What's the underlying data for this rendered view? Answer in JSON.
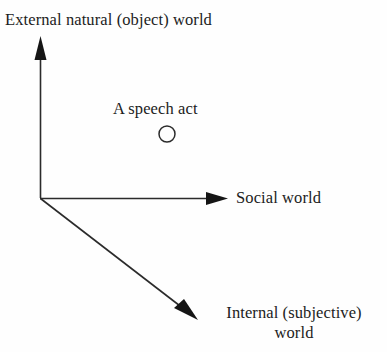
{
  "diagram": {
    "type": "three-axis-world-diagram",
    "background_color": "#fefefe",
    "line_color": "#2b2b2b",
    "text_color": "#1c1c1c",
    "origin": {
      "x": 40,
      "y": 198
    },
    "axes": [
      {
        "name": "vertical-axis",
        "label": "External natural (object) world",
        "direction": "up",
        "from": {
          "x": 40,
          "y": 198
        },
        "to": {
          "x": 40,
          "y": 36
        },
        "arrowhead": "solid-triangle"
      },
      {
        "name": "horizontal-axis",
        "label": "Social world",
        "direction": "right",
        "from": {
          "x": 40,
          "y": 198
        },
        "to": {
          "x": 228,
          "y": 198
        },
        "arrowhead": "solid-triangle"
      },
      {
        "name": "diagonal-axis",
        "label_line1": "Internal (subjective)",
        "label_line2": "world",
        "direction": "down-right",
        "from": {
          "x": 40,
          "y": 198
        },
        "to": {
          "x": 198,
          "y": 320
        },
        "arrowhead": "solid-triangle"
      }
    ],
    "point": {
      "name": "speech-act-point",
      "label": "A speech act",
      "marker": "hollow-circle",
      "center": {
        "x": 167,
        "y": 134
      },
      "radius": 8
    }
  }
}
